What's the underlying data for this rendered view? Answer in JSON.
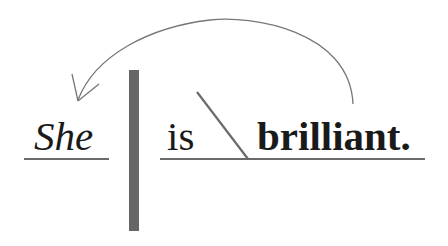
{
  "diagram": {
    "type": "sentence-diagram",
    "sentence": "She is brilliant.",
    "words": {
      "subject": "She",
      "verb": "is",
      "complement": "brilliant."
    },
    "word_styles": {
      "subject": "italic",
      "verb": "regular",
      "complement": "bold"
    },
    "relations": [
      {
        "from": "brilliant.",
        "to": "She",
        "kind": "arrow",
        "label": ""
      }
    ],
    "colors": {
      "text": "#1a1a1a",
      "lines": "#6b6b6b",
      "divider": "#666666",
      "arrow": "#777777",
      "background": "#ffffff"
    }
  }
}
